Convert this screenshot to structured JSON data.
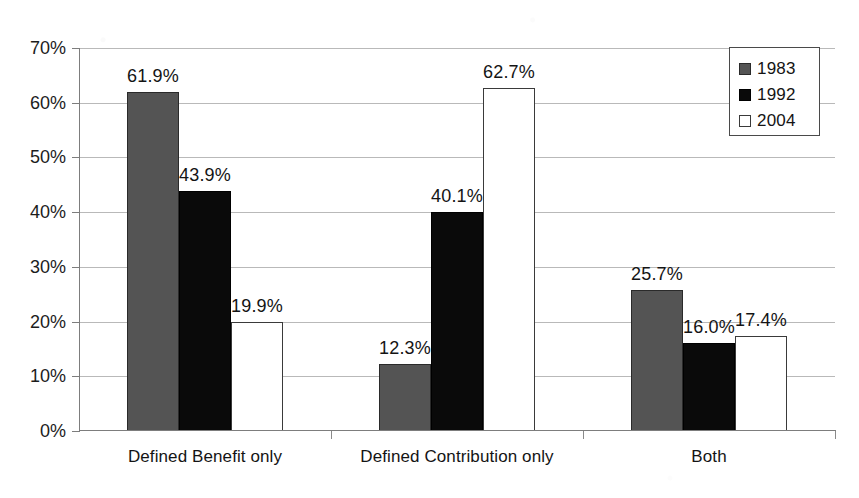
{
  "chart_data": {
    "type": "bar",
    "title": "",
    "subtitle": "",
    "xlabel": "",
    "ylabel": "",
    "categories": [
      "Defined Benefit only",
      "Defined Contribution only",
      "Both"
    ],
    "series": [
      {
        "name": "1983",
        "values": [
          61.9,
          12.3,
          25.7
        ],
        "color": "#545454"
      },
      {
        "name": "1992",
        "values": [
          43.9,
          40.1,
          16.0
        ],
        "color": "#0a0a0a"
      },
      {
        "name": "2004",
        "values": [
          19.9,
          62.7,
          17.4
        ],
        "color": "#ffffff"
      }
    ],
    "data_labels": [
      [
        "61.9%",
        "12.3%",
        "25.7%"
      ],
      [
        "43.9%",
        "40.1%",
        "16.0%"
      ],
      [
        "19.9%",
        "62.7%",
        "17.4%"
      ]
    ],
    "ylim": [
      0,
      70
    ],
    "ytick_values": [
      0,
      10,
      20,
      30,
      40,
      50,
      60,
      70
    ],
    "ytick_labels": [
      "0%",
      "10%",
      "20%",
      "30%",
      "40%",
      "50%",
      "60%",
      "70%"
    ],
    "grid": true,
    "legend_position": "top-right",
    "legend_entries": [
      "1983",
      "1992",
      "2004"
    ]
  }
}
